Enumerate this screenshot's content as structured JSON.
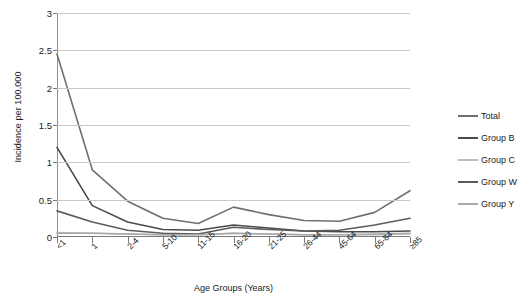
{
  "chart_data": {
    "type": "line",
    "title": "",
    "xlabel": "Age Groups (Years)",
    "ylabel": "Incidence per 100,000",
    "categories": [
      "<1",
      "1",
      "2-4",
      "5-10",
      "11-15",
      "16-20",
      "21-25",
      "26-44",
      "45-64",
      "65-84",
      "≥85"
    ],
    "yticks": [
      "0",
      "0.5",
      "1",
      "1.5",
      "2",
      "2.5",
      "3"
    ],
    "ylim": [
      0,
      3
    ],
    "grid": true,
    "legend_position": "right",
    "series": [
      {
        "name": "Total",
        "color": "#6f6f6f",
        "values": [
          2.45,
          0.9,
          0.48,
          0.25,
          0.18,
          0.4,
          0.3,
          0.22,
          0.21,
          0.33,
          0.62
        ]
      },
      {
        "name": "Group B",
        "color": "#4a4a4a",
        "values": [
          1.2,
          0.42,
          0.2,
          0.1,
          0.09,
          0.16,
          0.12,
          0.08,
          0.07,
          0.07,
          0.08
        ]
      },
      {
        "name": "Group C",
        "color": "#bcbcbc",
        "values": [
          0.06,
          0.05,
          0.04,
          0.03,
          0.03,
          0.05,
          0.04,
          0.03,
          0.03,
          0.03,
          0.04
        ]
      },
      {
        "name": "Group W",
        "color": "#5c5c5c",
        "values": [
          0.35,
          0.2,
          0.09,
          0.05,
          0.04,
          0.13,
          0.1,
          0.08,
          0.09,
          0.16,
          0.25
        ]
      },
      {
        "name": "Group Y",
        "color": "#a8a8a8",
        "values": [
          0.05,
          0.05,
          0.04,
          0.03,
          0.03,
          0.05,
          0.04,
          0.03,
          0.03,
          0.04,
          0.05
        ]
      }
    ]
  },
  "axis": {
    "grid_color": "#c9c9c9",
    "axis_color": "#7a7a7a"
  }
}
